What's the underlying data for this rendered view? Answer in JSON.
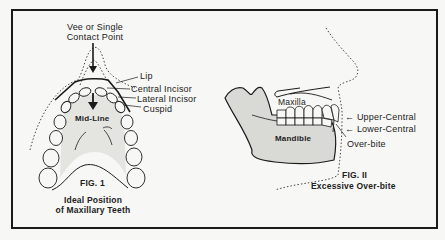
{
  "figure1": {
    "contact_point_label_line1": "Vee or Single",
    "contact_point_label_line2": "Contact Point",
    "labels": {
      "lip": "Lip",
      "central_incisor": "Central Incisor",
      "lateral_incisor": "Lateral Incisor",
      "cuspid": "Cuspid",
      "mid_line": "Mid-Line"
    },
    "fig_number": "FIG. 1",
    "caption_line1": "Ideal Position",
    "caption_line2": "of Maxillary Teeth"
  },
  "figure2": {
    "labels": {
      "maxilla": "Maxilla",
      "mandible": "Mandible",
      "upper_central": "← Upper-Central",
      "lower_central": "← Lower-Central",
      "over_bite": "Over-bite"
    },
    "fig_number": "FIG. II",
    "caption": "Excessive Over-bite"
  },
  "colors": {
    "ink": "#1a1a1a",
    "paper": "#f7f7f5",
    "shading": "#d9d9d6"
  }
}
